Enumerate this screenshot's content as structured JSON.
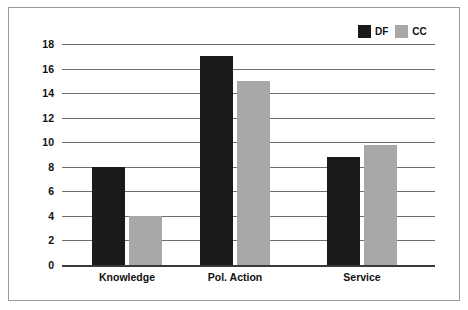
{
  "chart_data": {
    "type": "bar",
    "title": "",
    "subtitle": "",
    "xlabel": "",
    "ylabel": "",
    "categories": [
      "Knowledge",
      "Pol. Action",
      "Service"
    ],
    "series": [
      {
        "name": "DF",
        "color": "#1a1a1a",
        "values": [
          8,
          17,
          8.8
        ]
      },
      {
        "name": "CC",
        "color": "#a8a8a8",
        "values": [
          4,
          15,
          9.8
        ]
      }
    ],
    "ylim": [
      0,
      18
    ],
    "ytick_labels": [
      "18",
      "16",
      "14",
      "12",
      "10",
      "8",
      "6",
      "4",
      "2",
      "0"
    ],
    "ytick_values": [
      18,
      16,
      14,
      12,
      10,
      8,
      6,
      4,
      2,
      0
    ],
    "grid": true,
    "grid_axis": "y",
    "legend": {
      "position": "top-right",
      "entries": [
        "DF",
        "CC"
      ]
    },
    "frame": {
      "border_color": "#9a9a9a",
      "background": "#ffffff"
    },
    "gridline_color": "#6e6e6e",
    "baseline_color": "#3a3a3a"
  }
}
